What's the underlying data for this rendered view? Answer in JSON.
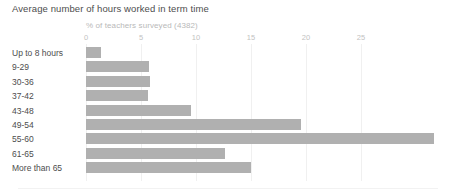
{
  "chart": {
    "title": "Average number of hours worked in term time",
    "subtitle": "% of teachers surveyed (4382)"
  },
  "chart_data": {
    "type": "bar",
    "orientation": "horizontal",
    "title": "Average number of hours worked in term time",
    "subtitle": "% of teachers surveyed (4382)",
    "xlabel": "% of teachers surveyed (4382)",
    "ylabel": "",
    "xlim": [
      0,
      32
    ],
    "xticks": [
      0,
      5,
      10,
      15,
      20,
      25
    ],
    "xtick_labels": [
      "0",
      "5",
      "10",
      "15",
      "20",
      "25"
    ],
    "grid": true,
    "legend": false,
    "bar_color": "#b0b0b0",
    "categories": [
      "Up to 8 hours",
      "9-29",
      "30-36",
      "37-42",
      "43-48",
      "49-54",
      "55-60",
      "61-65",
      "More than 65"
    ],
    "values": [
      1.4,
      5.7,
      5.8,
      5.6,
      9.5,
      19.5,
      31.6,
      12.6,
      15.0
    ]
  },
  "axis": {
    "ticks": [
      {
        "label": "0",
        "value": 0
      },
      {
        "label": "5",
        "value": 5
      },
      {
        "label": "10",
        "value": 10
      },
      {
        "label": "15",
        "value": 15
      },
      {
        "label": "20",
        "value": 20
      },
      {
        "label": "25",
        "value": 25
      }
    ]
  },
  "colors": {
    "bar": "#b0b0b0",
    "grid": "#f0f0f0",
    "title_text": "#4d4d4d",
    "subtitle_text": "#b9b9b9",
    "tick_text": "#c2c2c2",
    "background": "#ffffff"
  }
}
